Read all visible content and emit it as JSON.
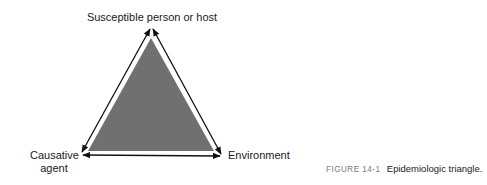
{
  "figure": {
    "type": "triangle-diagram",
    "vertices": {
      "top": "Susceptible person or host",
      "bottom_left": [
        "Causative",
        "agent"
      ],
      "bottom_right": "Environment"
    },
    "edges": [
      {
        "from": "top",
        "to": "bottom_left",
        "style": "double-arrow"
      },
      {
        "from": "top",
        "to": "bottom_right",
        "style": "double-arrow"
      },
      {
        "from": "bottom_left",
        "to": "bottom_right",
        "style": "double-arrow"
      }
    ],
    "fill_color": "#707070",
    "arrow_color": "#111111"
  },
  "caption": {
    "number": "FIGURE 14-1",
    "text": "Epidemiologic triangle."
  }
}
